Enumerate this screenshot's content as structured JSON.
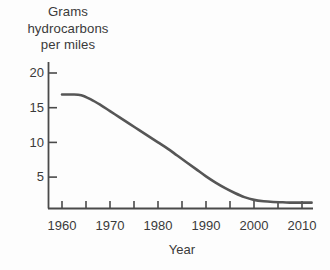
{
  "chart_data": {
    "type": "line",
    "title": "Grams hydrocarbons per miles",
    "title_lines": [
      "Grams",
      "hydrocarbons",
      "per miles"
    ],
    "xlabel": "Year",
    "ylabel": "Grams hydrocarbons per miles",
    "xlim": [
      1958,
      2013
    ],
    "ylim": [
      0,
      22
    ],
    "xticks": [
      1960,
      1970,
      1980,
      1990,
      2000,
      2010
    ],
    "xtick_labels": [
      "1960",
      "1970",
      "1980",
      "1990",
      "2000",
      "2010"
    ],
    "xticks_minor": [
      1965,
      1975,
      1985,
      1995,
      2005
    ],
    "yticks": [
      5,
      10,
      15,
      20
    ],
    "ytick_labels": [
      "5",
      "10",
      "15",
      "20"
    ],
    "grid": false,
    "legend": false,
    "series": [
      {
        "name": "Grams hydrocarbons per mile",
        "color": "#565656",
        "line_width": 2.6,
        "x": [
          1960,
          1962,
          1964,
          1966,
          1968,
          1970,
          1972,
          1974,
          1976,
          1978,
          1980,
          1982,
          1984,
          1986,
          1988,
          1990,
          1992,
          1994,
          1996,
          1998,
          2000,
          2002,
          2004,
          2006,
          2008,
          2010,
          2012
        ],
        "values": [
          16.9,
          16.9,
          16.8,
          16.2,
          15.4,
          14.5,
          13.6,
          12.7,
          11.8,
          10.9,
          10.0,
          9.1,
          8.1,
          7.1,
          6.1,
          5.1,
          4.2,
          3.4,
          2.7,
          2.1,
          1.7,
          1.5,
          1.4,
          1.35,
          1.3,
          1.3,
          1.3
        ]
      }
    ],
    "annotations": []
  },
  "axis": {
    "line_color": "#4a4a4a",
    "text_color": "#3a3a3a"
  },
  "xtick_display": [
    {
      "label": "1960",
      "x": 62
    },
    {
      "label": "1970",
      "x": 110
    },
    {
      "label": "1980",
      "x": 158
    },
    {
      "label": "1990",
      "x": 206
    },
    {
      "label": "2000",
      "x": 254
    },
    {
      "label": "2010",
      "x": 302
    }
  ],
  "ytick_display": [
    {
      "label": "20",
      "y": 73
    },
    {
      "label": "15",
      "y": 108
    },
    {
      "label": "10",
      "y": 142
    },
    {
      "label": "5",
      "y": 177
    }
  ]
}
